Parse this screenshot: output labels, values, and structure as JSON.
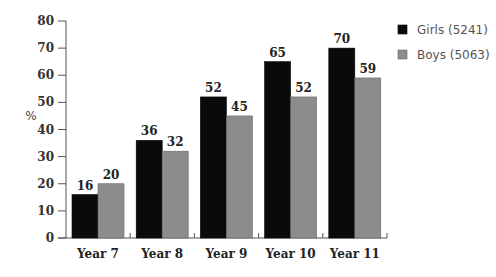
{
  "chart_data": {
    "type": "bar",
    "title": "",
    "xlabel": "",
    "ylabel": "%",
    "ylim": [
      0,
      80
    ],
    "yticks": [
      0,
      10,
      20,
      30,
      40,
      50,
      60,
      70,
      80
    ],
    "grid": false,
    "legend_position": "top-right",
    "categories": [
      "Year 7",
      "Year 8",
      "Year 9",
      "Year 10",
      "Year 11"
    ],
    "series": [
      {
        "name": "Girls (5241)",
        "color": "#0a0a0a",
        "values": [
          16,
          36,
          52,
          65,
          70
        ]
      },
      {
        "name": "Boys (5063)",
        "color": "#8c8c8c",
        "values": [
          20,
          32,
          45,
          52,
          59
        ]
      }
    ]
  }
}
